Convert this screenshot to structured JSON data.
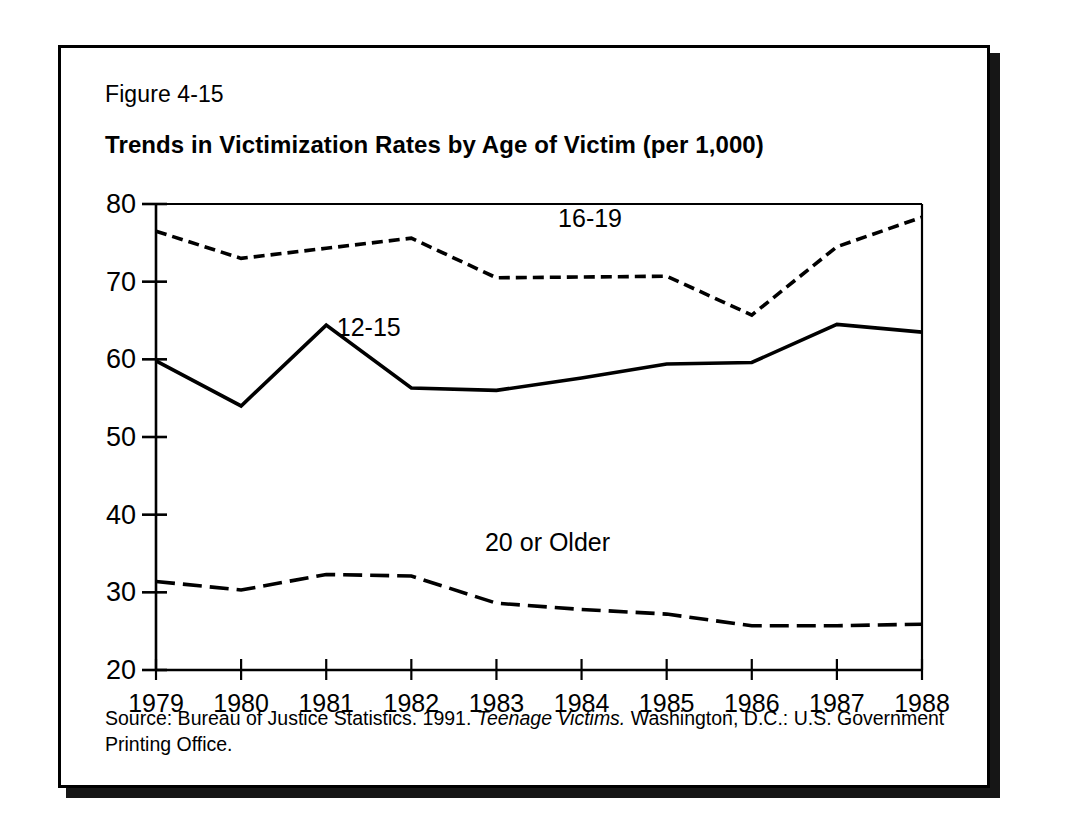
{
  "figure": {
    "number": "Figure 4-15",
    "title": "Trends in Victimization Rates by Age of Victim (per 1,000)",
    "source_prefix": "Source: Bureau of Justice Statistics. 1991. ",
    "source_italic": "Teenage Victims.",
    "source_suffix": " Washington, D.C.: U.S. Government Printing Office."
  },
  "colors": {
    "ink": "#000000",
    "paper": "#ffffff",
    "shadow": "#161616"
  },
  "chart_data": {
    "type": "line",
    "title": "Trends in Victimization Rates by Age of Victim (per 1,000)",
    "xlabel": "",
    "ylabel": "",
    "x": [
      1979,
      1980,
      1981,
      1982,
      1983,
      1984,
      1985,
      1986,
      1987,
      1988
    ],
    "xticklabels": [
      "1979",
      "1980",
      "1981",
      "1982",
      "1983",
      "1984",
      "1985",
      "1986",
      "1987",
      "1988"
    ],
    "yticks": [
      20,
      30,
      40,
      50,
      60,
      70,
      80
    ],
    "yticklabels": [
      "20",
      "30",
      "40",
      "50",
      "60",
      "70",
      "80"
    ],
    "xlim": [
      1979,
      1988
    ],
    "ylim": [
      20,
      80
    ],
    "grid": false,
    "legend": "inline-labels",
    "series": [
      {
        "name": "16-19",
        "label": "16-19",
        "linestyle": "dashed-short",
        "values": [
          76.5,
          73.0,
          74.3,
          75.6,
          70.5,
          70.6,
          70.7,
          65.7,
          74.5,
          78.3
        ]
      },
      {
        "name": "12-15",
        "label": "12-15",
        "linestyle": "solid",
        "values": [
          59.8,
          54.0,
          64.4,
          56.3,
          56.0,
          57.6,
          59.4,
          59.6,
          64.5,
          63.5
        ]
      },
      {
        "name": "20 or Older",
        "label": "20 or Older",
        "linestyle": "dashed-long",
        "values": [
          31.4,
          30.3,
          32.3,
          32.1,
          28.6,
          27.8,
          27.2,
          25.7,
          25.7,
          25.9
        ]
      }
    ],
    "annotations": [
      {
        "text": "16-19",
        "x": 1984.1,
        "y": 77.0
      },
      {
        "text": "12-15",
        "x": 1981.5,
        "y": 63.0
      },
      {
        "text": "20 or Older",
        "x": 1983.6,
        "y": 35.3
      }
    ]
  }
}
